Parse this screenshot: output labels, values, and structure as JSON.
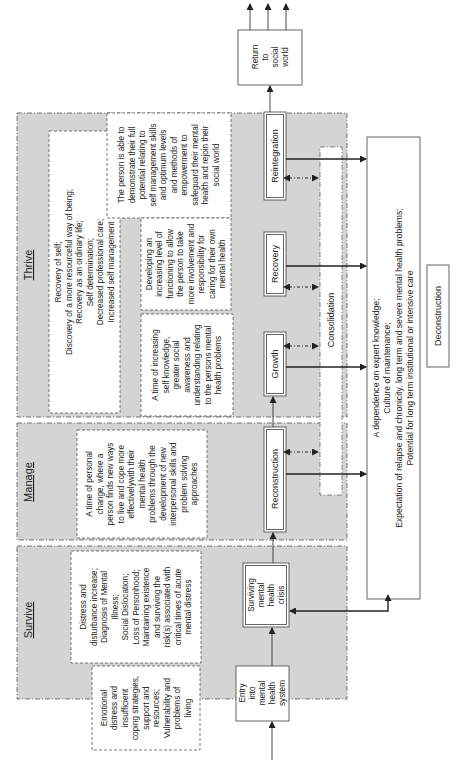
{
  "phases": {
    "thrive": {
      "label": "Thrive"
    },
    "manage": {
      "label": "Manage"
    },
    "survive": {
      "label": "Survive"
    }
  },
  "notes": {
    "thrive_summary": [
      "Recovery of self;",
      "Discovery of a more resourceful way of being;",
      "Recovery as an ordinary life;",
      "Self determination;",
      "Decreased professional care;",
      "Increased self management"
    ],
    "reintegration_desc": [
      "The person is able to",
      "demonstrate their full",
      "potential relating to",
      "self management skills",
      "and optimum levels",
      "and methods of",
      "empowerment to",
      "safeguard their mental",
      "health and rejoin their",
      "social world"
    ],
    "recovery_desc": [
      "Developing an",
      "increasing level of",
      "functioning to allow",
      "the person to take",
      "more involvement and",
      "responsibility for",
      "caring for their own",
      "mental health"
    ],
    "growth_desc": [
      "A time of increasing",
      "self knowledge,",
      "greater social",
      "awareness and",
      "understanding relating",
      "to the persons mental",
      "health problems"
    ],
    "manage_desc": [
      "A time of personal",
      "change, where a",
      "person finds new ways",
      "to live and cope more",
      "effectivelywith their",
      "mental health",
      "problems through the",
      "development of new",
      "interpersonal skills and",
      "problem solving",
      "approaches"
    ],
    "survive_desc": [
      "Distress and",
      "disturbance increase;",
      "Diagnosis of Mental",
      "Illness;",
      "Social Dislocation;",
      "Loss of Personhood;",
      "Maintaining existence",
      "and surviving the",
      "risk(s) associated with",
      "critical times of acute",
      "mental distress"
    ],
    "entry_desc": [
      "Emotional",
      "distress and",
      "insufficient",
      "coping strategies,",
      "support and",
      "resources;",
      "Vulnerability and",
      "problems of",
      "living"
    ]
  },
  "stages": {
    "entry": [
      "Entry",
      "into",
      "mental",
      "health",
      "system"
    ],
    "surviving": [
      "Surviving",
      "mental",
      "health",
      "crisis"
    ],
    "reconstruction": "Reconstruction",
    "growth": "Growth",
    "recovery": "Recovery",
    "reintegration": "Reintegration",
    "return": [
      "Return",
      "to",
      "social",
      "world"
    ],
    "consolidation": "Consolidation",
    "deconstruction": "Deconstruction"
  },
  "dependence_box": [
    "A dependence on expert knowledge;",
    "Culture of maintenance;",
    "Expectation of relapse and chronicity, long term and severe mental health problems;",
    "Potential for long term institutional or intensive care"
  ]
}
